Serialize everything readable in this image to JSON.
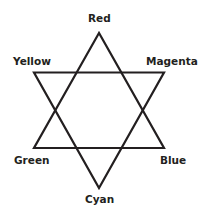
{
  "diagram": {
    "type": "hexagram color relationship",
    "stroke_color": "#231f20",
    "labels": {
      "top": "Red",
      "upper_left": "Yellow",
      "upper_right": "Magenta",
      "lower_left": "Green",
      "lower_right": "Blue",
      "bottom": "Cyan"
    },
    "triangles": [
      {
        "name": "upward",
        "vertices": [
          "Red",
          "Green",
          "Blue"
        ]
      },
      {
        "name": "downward",
        "vertices": [
          "Yellow",
          "Magenta",
          "Cyan"
        ]
      }
    ]
  }
}
